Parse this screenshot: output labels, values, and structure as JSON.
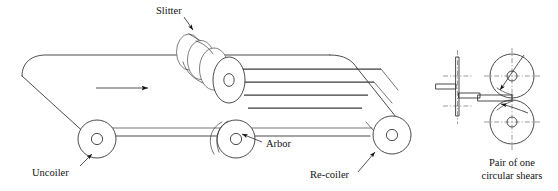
{
  "figure": {
    "kind": "engineering-line-diagram",
    "background_color": "#ffffff",
    "line_color": "#2a2a2a",
    "centerline_color": "#55595c"
  },
  "labels": {
    "slitter": "Slitter",
    "uncoiler": "Uncoiler",
    "arbor": "Arbor",
    "recoiler": "Re-coiler",
    "shears_line1": "Pair of one",
    "shears_line2": "circular shears"
  },
  "annotations": {
    "feed_direction": "right",
    "strip_count": 4,
    "slitter_disc_count": 4,
    "roller_count": 3,
    "detail_views": [
      "blade-side-section",
      "circular-shears-pair"
    ]
  }
}
